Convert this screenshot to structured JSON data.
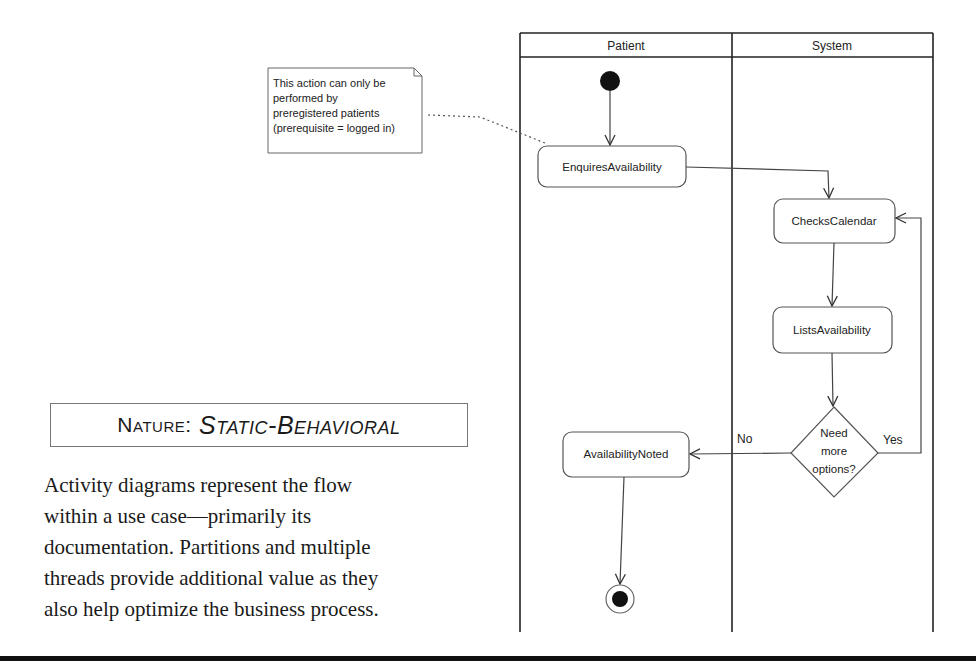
{
  "diagram": {
    "type": "UML activity diagram",
    "lanes": [
      {
        "id": "patient",
        "title": "Patient"
      },
      {
        "id": "system",
        "title": "System"
      }
    ],
    "nodes": {
      "start": {
        "kind": "initial",
        "lane": "patient"
      },
      "enquires": {
        "kind": "action",
        "lane": "patient",
        "label": "EnquiresAvailability"
      },
      "checks": {
        "kind": "action",
        "lane": "system",
        "label": "ChecksCalendar"
      },
      "lists": {
        "kind": "action",
        "lane": "system",
        "label": "ListsAvailability"
      },
      "decision": {
        "kind": "decision",
        "lane": "system",
        "lines": [
          "Need",
          "more",
          "options?"
        ]
      },
      "noted": {
        "kind": "action",
        "lane": "patient",
        "label": "AvailabilityNoted"
      },
      "end": {
        "kind": "final",
        "lane": "patient"
      }
    },
    "edges": [
      {
        "from": "start",
        "to": "enquires",
        "guard": ""
      },
      {
        "from": "enquires",
        "to": "checks",
        "guard": ""
      },
      {
        "from": "checks",
        "to": "lists",
        "guard": ""
      },
      {
        "from": "lists",
        "to": "decision",
        "guard": ""
      },
      {
        "from": "decision",
        "to": "noted",
        "guard": "No"
      },
      {
        "from": "decision",
        "to": "checks",
        "guard": "Yes"
      },
      {
        "from": "noted",
        "to": "end",
        "guard": ""
      }
    ],
    "guards": {
      "no": "No",
      "yes": "Yes"
    },
    "note": {
      "attached_to": "enquires",
      "lines": [
        "This action can only be",
        "performed by",
        "preregistered patients",
        "(prerequisite = logged in)"
      ]
    }
  },
  "nature": {
    "key": "Nature",
    "separator": ":",
    "value": "Static-Behavioral"
  },
  "description": {
    "lines": [
      "Activity diagrams represent the flow",
      "within a use case—primarily its",
      "documentation. Partitions and multiple",
      "threads provide additional value as they",
      "also help optimize the business process."
    ]
  }
}
